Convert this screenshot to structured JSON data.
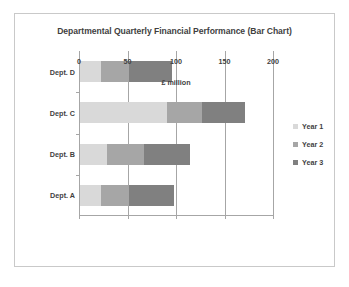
{
  "chart_data": {
    "type": "bar",
    "orientation": "horizontal",
    "stacked": true,
    "title": "Departmental Quarterly Financial Performance (Bar Chart)",
    "xlabel": "£ million",
    "ylabel": "",
    "categories": [
      "Dept. A",
      "Dept. B",
      "Dept. C",
      "Dept. D"
    ],
    "category_order_top_to_bottom": [
      "Dept. D",
      "Dept. C",
      "Dept. B",
      "Dept. A"
    ],
    "series": [
      {
        "name": "Year 1",
        "color": "#d9d9d9",
        "values": [
          22,
          28,
          90,
          22
        ]
      },
      {
        "name": "Year 2",
        "color": "#a6a6a6",
        "values": [
          29,
          38,
          36,
          29
        ]
      },
      {
        "name": "Year 3",
        "color": "#808080",
        "values": [
          46,
          47,
          44,
          44
        ]
      }
    ],
    "totals": [
      97,
      113,
      170,
      95
    ],
    "xlim": [
      0,
      200
    ],
    "xticks": [
      0,
      50,
      100,
      150,
      200
    ],
    "xtick_labels": [
      "0",
      "50",
      "100",
      "150",
      "200"
    ],
    "grid": "vertical",
    "legend_position": "right",
    "legend_entries": [
      "Year 1",
      "Year 2",
      "Year 3"
    ]
  },
  "colors": {
    "frame_border": "#c9c9c9",
    "axis": "#a6a6a6",
    "text": "#3f3f3f",
    "background": "#ffffff"
  }
}
